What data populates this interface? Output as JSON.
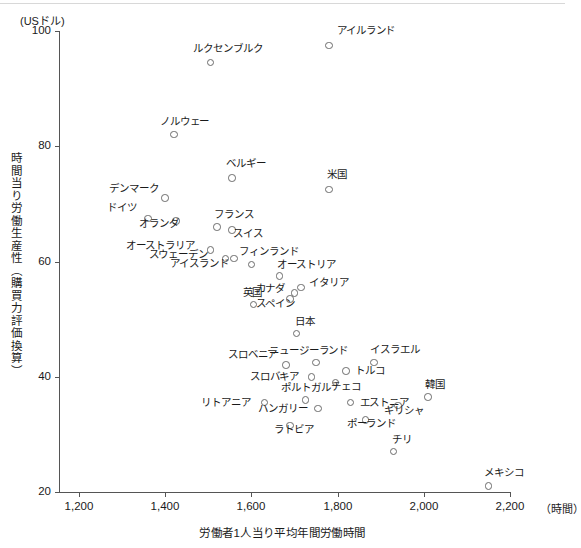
{
  "chart_data": {
    "type": "scatter",
    "title": "",
    "xlabel": "労働者1人当り平均年間労働時間",
    "ylabel": "時間当り労働生産性（購買力評価換算）",
    "x_unit": "（時間）",
    "y_unit": "(USドル)",
    "xlim": [
      1150,
      2250
    ],
    "ylim": [
      18,
      102
    ],
    "xticks": [
      1200,
      1400,
      1600,
      1800,
      2000,
      2200
    ],
    "xtick_labels": [
      "1,200",
      "1,400",
      "1,600",
      "1,800",
      "2,000",
      "2,200"
    ],
    "yticks": [
      20,
      40,
      60,
      80,
      100
    ],
    "ytick_labels": [
      "20",
      "40",
      "60",
      "80",
      "100"
    ],
    "grid": false,
    "legend": "none",
    "marker": "open-circle",
    "points": [
      {
        "label": "アイルランド",
        "x": 1780,
        "y": 97.5,
        "lx": 8,
        "ly": -15
      },
      {
        "label": "ルクセンブルク",
        "x": 1505,
        "y": 94.5,
        "lx": -17,
        "ly": -15
      },
      {
        "label": "ノルウェー",
        "x": 1420,
        "y": 82.0,
        "lx": -14,
        "ly": -14
      },
      {
        "label": "ベルギー",
        "x": 1555,
        "y": 74.5,
        "lx": -6,
        "ly": -15
      },
      {
        "label": "米国",
        "x": 1780,
        "y": 72.5,
        "lx": -2,
        "ly": -15
      },
      {
        "label": "デンマーク",
        "x": 1400,
        "y": 71.0,
        "lx": -56,
        "ly": -10
      },
      {
        "label": "ドイツ",
        "x": 1360,
        "y": 67.5,
        "lx": -41,
        "ly": -11
      },
      {
        "label": "オランダ",
        "x": 1425,
        "y": 67.0,
        "lx": -37,
        "ly": 2
      },
      {
        "label": "フランス",
        "x": 1520,
        "y": 66.0,
        "lx": -3,
        "ly": -13
      },
      {
        "label": "スイス",
        "x": 1555,
        "y": 65.5,
        "lx": 1,
        "ly": 3
      },
      {
        "label": "オーストラリア",
        "x": 1505,
        "y": 62.0,
        "lx": -84,
        "ly": -5
      },
      {
        "label": "スウェーデン",
        "x": 1540,
        "y": 60.5,
        "lx": -77,
        "ly": -5
      },
      {
        "label": "アイスランド",
        "x": 1560,
        "y": 60.5,
        "lx": -64,
        "ly": 4
      },
      {
        "label": "フィンランド",
        "x": 1600,
        "y": 59.5,
        "lx": -12,
        "ly": -13
      },
      {
        "label": "オーストリア",
        "x": 1665,
        "y": 57.5,
        "lx": -2,
        "ly": -12
      },
      {
        "label": "イタリア",
        "x": 1715,
        "y": 55.5,
        "lx": 8,
        "ly": -5
      },
      {
        "label": "カナダ",
        "x": 1700,
        "y": 54.5,
        "lx": -39,
        "ly": -5
      },
      {
        "label": "スペイン",
        "x": 1690,
        "y": 53.5,
        "lx": -34,
        "ly": 4
      },
      {
        "label": "英国",
        "x": 1605,
        "y": 52.5,
        "lx": -11,
        "ly": -13
      },
      {
        "label": "日本",
        "x": 1705,
        "y": 47.5,
        "lx": -2,
        "ly": -13
      },
      {
        "label": "ニュージーランド",
        "x": 1750,
        "y": 42.5,
        "lx": -47,
        "ly": -12
      },
      {
        "label": "イスラエル",
        "x": 1885,
        "y": 42.5,
        "lx": -4,
        "ly": -13
      },
      {
        "label": "スロベニア",
        "x": 1680,
        "y": 42.0,
        "lx": -58,
        "ly": -11
      },
      {
        "label": "スロバキア",
        "x": 1740,
        "y": 40.0,
        "lx": -62,
        "ly": -1
      },
      {
        "label": "トルコ",
        "x": 1820,
        "y": 41.0,
        "lx": 9,
        "ly": -1
      },
      {
        "label": "チェコ",
        "x": 1795,
        "y": 39.0,
        "lx": -4,
        "ly": 3
      },
      {
        "label": "ポルトガル",
        "x": 1725,
        "y": 36.0,
        "lx": -24,
        "ly": -13
      },
      {
        "label": "韓国",
        "x": 2010,
        "y": 36.5,
        "lx": -3,
        "ly": -13
      },
      {
        "label": "エストニア",
        "x": 1830,
        "y": 35.5,
        "lx": 9,
        "ly": -1
      },
      {
        "label": "リトアニア",
        "x": 1630,
        "y": 35.5,
        "lx": -63,
        "ly": -1
      },
      {
        "label": "ハンガリー",
        "x": 1755,
        "y": 34.5,
        "lx": -60,
        "ly": 0
      },
      {
        "label": "ギリシャ",
        "x": 1940,
        "y": 35.0,
        "lx": -14,
        "ly": 4
      },
      {
        "label": "ポーランド",
        "x": 1865,
        "y": 32.5,
        "lx": -19,
        "ly": 3
      },
      {
        "label": "ラトビア",
        "x": 1690,
        "y": 31.5,
        "lx": -16,
        "ly": 3
      },
      {
        "label": "チリ",
        "x": 1930,
        "y": 27.0,
        "lx": -2,
        "ly": -13
      },
      {
        "label": "メキシコ",
        "x": 2150,
        "y": 21.0,
        "lx": -4,
        "ly": -14
      }
    ]
  }
}
